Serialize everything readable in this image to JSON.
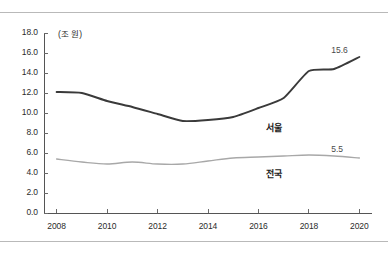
{
  "chart_data": {
    "type": "line",
    "title": "",
    "subtitle": "",
    "xlabel": "",
    "ylabel": "",
    "unit_label": "(조 원)",
    "xlim": [
      2007.5,
      2020.5
    ],
    "ylim": [
      0.0,
      18.0
    ],
    "grid": false,
    "legend_position": "inline-annotations",
    "x": [
      2008,
      2009,
      2010,
      2011,
      2012,
      2013,
      2014,
      2015,
      2016,
      2017,
      2018,
      2019,
      2020
    ],
    "xtick_labels": [
      "2008",
      "2010",
      "2012",
      "2014",
      "2016",
      "2018",
      "2020"
    ],
    "xticks": [
      2008,
      2010,
      2012,
      2014,
      2016,
      2018,
      2020
    ],
    "ytick_labels": [
      "0.0",
      "2.0",
      "4.0",
      "6.0",
      "8.0",
      "10.0",
      "12.0",
      "14.0",
      "16.0",
      "18.0"
    ],
    "yticks": [
      0.0,
      2.0,
      4.0,
      6.0,
      8.0,
      10.0,
      12.0,
      14.0,
      16.0,
      18.0
    ],
    "series": [
      {
        "name": "서울",
        "label": "서울",
        "color": "#3a3a3a",
        "width": 1.9,
        "values": [
          12.1,
          12.0,
          11.2,
          10.6,
          9.9,
          9.2,
          9.3,
          9.6,
          10.5,
          11.5,
          14.2,
          14.4,
          15.6
        ],
        "end_value_label": "15.6"
      },
      {
        "name": "전국",
        "label": "전국",
        "color": "#a8a8a8",
        "width": 1.3,
        "values": [
          5.4,
          5.1,
          4.9,
          5.1,
          4.9,
          4.9,
          5.2,
          5.5,
          5.6,
          5.7,
          5.8,
          5.7,
          5.5
        ],
        "end_value_label": "5.5"
      }
    ],
    "annotations": [
      {
        "text": "15.6",
        "x": 2019.2,
        "y": 16.2
      },
      {
        "text": "5.5",
        "x": 2019.2,
        "y": 6.3
      },
      {
        "text": "서울",
        "x": 2016.6,
        "y": 8.6
      },
      {
        "text": "전국",
        "x": 2016.6,
        "y": 4.0
      }
    ]
  }
}
